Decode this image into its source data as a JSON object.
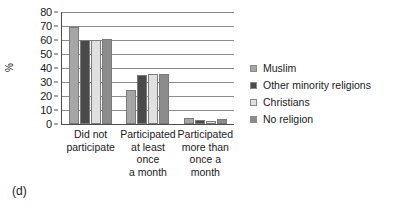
{
  "caption": "(d)",
  "chart_data": {
    "type": "bar",
    "title": "",
    "subtitle": "",
    "xlabel": "",
    "ylabel": "%",
    "ylim": [
      0,
      80
    ],
    "ytick_step": 10,
    "yticks": [
      0,
      10,
      20,
      30,
      40,
      50,
      60,
      70,
      80
    ],
    "ytick_labels": [
      "0",
      "10",
      "20",
      "30",
      "40",
      "50",
      "60",
      "70",
      "80"
    ],
    "grid": true,
    "grid_axis": "y",
    "legend_position": "right",
    "categories": [
      "Did not\nparticipate",
      "Participated\nat least\nonce\na month",
      "Participated\nmore than\nonce a\nmonth"
    ],
    "series": [
      {
        "name": "Muslim",
        "color": "#a6a6a6",
        "values": [
          69,
          24,
          4.5
        ]
      },
      {
        "name": "Other minority religions",
        "color": "#4a4a4a",
        "values": [
          60,
          35,
          3
        ]
      },
      {
        "name": "Christians",
        "color": "#e0e0e0",
        "values": [
          60,
          36,
          2.5
        ]
      },
      {
        "name": "No religion",
        "color": "#8c8c8c",
        "values": [
          61,
          35.5,
          3.5
        ]
      }
    ]
  },
  "legend": {
    "items": [
      {
        "label": "Muslim",
        "color": "#a6a6a6"
      },
      {
        "label": "Other minority religions",
        "color": "#4a4a4a"
      },
      {
        "label": "Christians",
        "color": "#e0e0e0"
      },
      {
        "label": "No religion",
        "color": "#8c8c8c"
      }
    ]
  }
}
